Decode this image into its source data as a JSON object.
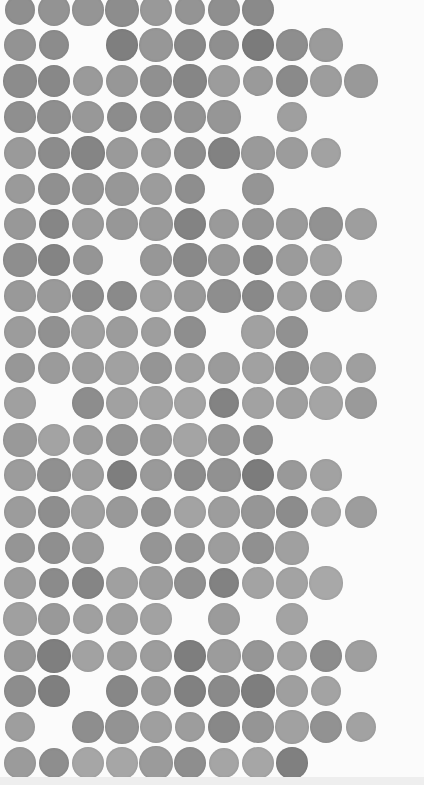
{
  "artwork": {
    "description": "Grid of hand-painted gray watercolor dots on white paper",
    "background": "#fbfbfb",
    "grid": {
      "columns_x": [
        20,
        54,
        88,
        122,
        156,
        190,
        224,
        258,
        292,
        326,
        361
      ],
      "rows_y": [
        10,
        45,
        81,
        117,
        153,
        189,
        224,
        260,
        296,
        332,
        368,
        403,
        440,
        475,
        512,
        548,
        583,
        619,
        656,
        691,
        727,
        763
      ],
      "dot_diameter": 32
    },
    "rows": [
      {
        "pattern": "11111111000",
        "shades": [
          "#8f8f8f",
          "#939393",
          "#959595",
          "#8d8d8d",
          "#999999",
          "#949494",
          "#8f8f8f",
          "#8a8a8a"
        ]
      },
      {
        "pattern": "11011111110",
        "shades": [
          "#939393",
          "#8c8c8c",
          "#7f7f7f",
          "#979797",
          "#888888",
          "#8f8f8f",
          "#7b7b7b",
          "#8e8e8e",
          "#9b9b9b"
        ]
      },
      {
        "pattern": "11111111111",
        "shades": [
          "#8c8c8c",
          "#888888",
          "#9a9a9a",
          "#979797",
          "#909090",
          "#868686",
          "#9c9c9c",
          "#9a9a9a",
          "#8a8a8a",
          "#9d9d9d",
          "#999999"
        ]
      },
      {
        "pattern": "11111110100",
        "shades": [
          "#8f8f8f",
          "#8f8f8f",
          "#989898",
          "#8c8c8c",
          "#909090",
          "#939393",
          "#969696",
          "#9f9f9f"
        ]
      },
      {
        "pattern": "11111111110",
        "shades": [
          "#9a9a9a",
          "#8c8c8c",
          "#858585",
          "#9a9a9a",
          "#9b9b9b",
          "#8e8e8e",
          "#828282",
          "#9a9a9a",
          "#9c9c9c",
          "#a2a2a2"
        ]
      },
      {
        "pattern": "11111101000",
        "shades": [
          "#9a9a9a",
          "#909090",
          "#959595",
          "#979797",
          "#9c9c9c",
          "#8e8e8e",
          "#959595"
        ]
      },
      {
        "pattern": "11111111111",
        "shades": [
          "#989898",
          "#868686",
          "#9b9b9b",
          "#979797",
          "#9a9a9a",
          "#838383",
          "#9a9a9a",
          "#959595",
          "#9a9a9a",
          "#929292",
          "#9e9e9e"
        ]
      },
      {
        "pattern": "11101111110",
        "shades": [
          "#8e8e8e",
          "#848484",
          "#959595",
          "#979797",
          "#898989",
          "#979797",
          "#878787",
          "#9b9b9b",
          "#a1a1a1"
        ]
      },
      {
        "pattern": "11111111111",
        "shades": [
          "#999999",
          "#9a9a9a",
          "#8c8c8c",
          "#8a8a8a",
          "#9f9f9f",
          "#999999",
          "#8e8e8e",
          "#898989",
          "#9d9d9d",
          "#979797",
          "#a3a3a3"
        ]
      },
      {
        "pattern": "11111101100",
        "shades": [
          "#9c9c9c",
          "#919191",
          "#a0a0a0",
          "#9c9c9c",
          "#9e9e9e",
          "#8e8e8e",
          "#a1a1a1",
          "#919191"
        ]
      },
      {
        "pattern": "11111111111",
        "shades": [
          "#979797",
          "#9b9b9b",
          "#9c9c9c",
          "#a1a1a1",
          "#959595",
          "#9f9f9f",
          "#9b9b9b",
          "#a1a1a1",
          "#8f8f8f",
          "#a1a1a1",
          "#9f9f9f"
        ]
      },
      {
        "pattern": "10111111111",
        "shades": [
          "#a0a0a0",
          "#8d8d8d",
          "#a1a1a1",
          "#a3a3a3",
          "#a4a4a4",
          "#838383",
          "#a2a2a2",
          "#9f9f9f",
          "#a5a5a5",
          "#9a9a9a"
        ]
      },
      {
        "pattern": "11111111000",
        "shades": [
          "#999999",
          "#a3a3a3",
          "#9c9c9c",
          "#939393",
          "#9a9a9a",
          "#a4a4a4",
          "#959595",
          "#8d8d8d"
        ]
      },
      {
        "pattern": "11111111110",
        "shades": [
          "#9c9c9c",
          "#909090",
          "#9e9e9e",
          "#7e7e7e",
          "#9a9a9a",
          "#8c8c8c",
          "#919191",
          "#7c7c7c",
          "#999999",
          "#a2a2a2"
        ]
      },
      {
        "pattern": "11111111111",
        "shades": [
          "#9c9c9c",
          "#8e8e8e",
          "#a0a0a0",
          "#999999",
          "#929292",
          "#a3a3a3",
          "#9d9d9d",
          "#969696",
          "#8c8c8c",
          "#a4a4a4",
          "#9d9d9d"
        ]
      },
      {
        "pattern": "11101111100",
        "shades": [
          "#959595",
          "#8f8f8f",
          "#9a9a9a",
          "#959595",
          "#939393",
          "#9d9d9d",
          "#909090",
          "#a0a0a0"
        ]
      },
      {
        "pattern": "11111111110",
        "shades": [
          "#9c9c9c",
          "#8b8b8b",
          "#858585",
          "#a0a0a0",
          "#9d9d9d",
          "#909090",
          "#828282",
          "#a3a3a3",
          "#a3a3a3",
          "#a8a8a8"
        ]
      },
      {
        "pattern": "11111010100",
        "shades": [
          "#a0a0a0",
          "#999999",
          "#a0a0a0",
          "#9e9e9e",
          "#a2a2a2",
          "#9b9b9b",
          "#a3a3a3"
        ]
      },
      {
        "pattern": "11111111111",
        "shades": [
          "#979797",
          "#7f7f7f",
          "#a2a2a2",
          "#9d9d9d",
          "#9d9d9d",
          "#7e7e7e",
          "#9c9c9c",
          "#969696",
          "#a1a1a1",
          "#8c8c8c",
          "#9f9f9f"
        ]
      },
      {
        "pattern": "11011111110",
        "shades": [
          "#8d8d8d",
          "#7f7f7f",
          "#878787",
          "#999999",
          "#818181",
          "#8a8a8a",
          "#7e7e7e",
          "#9f9f9f",
          "#a3a3a3"
        ]
      },
      {
        "pattern": "10111111111",
        "shades": [
          "#9e9e9e",
          "#8e8e8e",
          "#939393",
          "#9f9f9f",
          "#9d9d9d",
          "#888888",
          "#959595",
          "#a1a1a1",
          "#929292",
          "#a2a2a2"
        ]
      },
      {
        "pattern": "11111111100",
        "shades": [
          "#9b9b9b",
          "#8e8e8e",
          "#a6a6a6",
          "#a6a6a6",
          "#9b9b9b",
          "#8e8e8e",
          "#a5a5a5",
          "#a6a6a6",
          "#808080"
        ]
      }
    ]
  }
}
